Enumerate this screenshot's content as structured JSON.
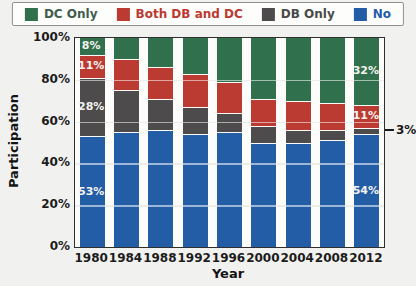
{
  "legend": {
    "items": [
      {
        "label": "DC Only",
        "swatch_color": "#30704d",
        "label_color": "#3f5c4c"
      },
      {
        "label": "Both DB and DC",
        "swatch_color": "#bb3a31",
        "label_color": "#bb3a31"
      },
      {
        "label": "DB Only",
        "swatch_color": "#4d4b4b",
        "label_color": "#494949"
      },
      {
        "label": "No",
        "swatch_color": "#235da6",
        "label_color": "#235da6"
      }
    ]
  },
  "chart_data": {
    "type": "bar",
    "stacked": true,
    "title": "",
    "xlabel": "Year",
    "ylabel": "Participation",
    "ylim": [
      0,
      100
    ],
    "yticks": [
      {
        "label": "0%",
        "value": 0
      },
      {
        "label": "20%",
        "value": 20
      },
      {
        "label": "40%",
        "value": 40
      },
      {
        "label": "60%",
        "value": 60
      },
      {
        "label": "80%",
        "value": 80
      },
      {
        "label": "100%",
        "value": 100
      }
    ],
    "grid": true,
    "legend_position": "top",
    "categories": [
      "1980",
      "1984",
      "1988",
      "1992",
      "1996",
      "2000",
      "2004",
      "2008",
      "2012"
    ],
    "series": [
      {
        "name": "DC Only",
        "color": "#30704d",
        "values": [
          8,
          10,
          14,
          17,
          21,
          29,
          30,
          31,
          32
        ]
      },
      {
        "name": "Both DB and DC",
        "color": "#bb3a31",
        "values": [
          11,
          15,
          15,
          16,
          15,
          13,
          14,
          13,
          11
        ]
      },
      {
        "name": "DB Only",
        "color": "#4d4b4b",
        "values": [
          28,
          20,
          15,
          13,
          9,
          8,
          6,
          5,
          3
        ]
      },
      {
        "name": "No",
        "color": "#235da6",
        "values": [
          53,
          55,
          56,
          54,
          55,
          50,
          50,
          51,
          54
        ]
      }
    ],
    "segment_labels": [
      {
        "category": "1980",
        "series": "DC Only",
        "text": "8%"
      },
      {
        "category": "1980",
        "series": "Both DB and DC",
        "text": "11%"
      },
      {
        "category": "1980",
        "series": "DB Only",
        "text": "28%"
      },
      {
        "category": "1980",
        "series": "No",
        "text": "53%"
      },
      {
        "category": "2012",
        "series": "DC Only",
        "text": "32%"
      },
      {
        "category": "2012",
        "series": "Both DB and DC",
        "text": "11%"
      },
      {
        "category": "2012",
        "series": "No",
        "text": "54%"
      }
    ],
    "annotation": {
      "text": "3%",
      "category": "2012",
      "series": "DB Only"
    }
  }
}
